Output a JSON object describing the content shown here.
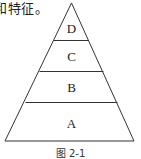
{
  "top_text": "和特征。",
  "pyramid": {
    "levels": [
      {
        "label": "D",
        "position": "top"
      },
      {
        "label": "C",
        "position": "second"
      },
      {
        "label": "B",
        "position": "third"
      },
      {
        "label": "A",
        "position": "bottom"
      }
    ]
  },
  "caption": "图 2-1"
}
